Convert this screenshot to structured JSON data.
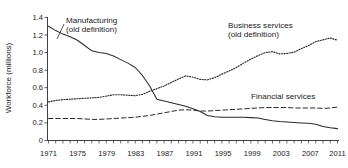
{
  "chart_data": {
    "type": "line",
    "title": "",
    "subtitle": "",
    "xlabel": "",
    "ylabel": "Workforce (millions)",
    "xlim": [
      1971,
      2011
    ],
    "ylim": [
      0,
      1.4
    ],
    "grid": false,
    "legend_position": "inline-annotations",
    "y_ticks": [
      "0",
      "0.2",
      "0.4",
      "0.6",
      "0.8",
      "1.0",
      "1.2",
      "1.4"
    ],
    "y_tick_values": [
      0,
      0.2,
      0.4,
      0.6,
      0.8,
      1.0,
      1.2,
      1.4
    ],
    "x_ticks": [
      "1971",
      "1975",
      "1979",
      "1983",
      "1987",
      "1991",
      "1995",
      "1999",
      "2003",
      "2007",
      "2011"
    ],
    "x_tick_values": [
      1971,
      1975,
      1979,
      1983,
      1987,
      1991,
      1995,
      1999,
      2003,
      2007,
      2011
    ],
    "x_minor_tick_interval": 1,
    "x": [
      1971,
      1972,
      1973,
      1974,
      1975,
      1976,
      1977,
      1978,
      1979,
      1980,
      1981,
      1982,
      1983,
      1984,
      1985,
      1986,
      1987,
      1988,
      1989,
      1990,
      1991,
      1992,
      1993,
      1994,
      1995,
      1996,
      1997,
      1998,
      1999,
      2000,
      2001,
      2002,
      2003,
      2004,
      2005,
      2006,
      2007,
      2008,
      2009,
      2010,
      2011
    ],
    "series": [
      {
        "name": "Manufacturing (old definition)",
        "style": "solid",
        "color": "#2b2b2b",
        "values": [
          1.3,
          1.25,
          1.21,
          1.18,
          1.14,
          1.08,
          1.02,
          1.0,
          0.99,
          0.96,
          0.92,
          0.88,
          0.83,
          0.74,
          0.62,
          0.47,
          0.45,
          0.43,
          0.41,
          0.39,
          0.36,
          0.33,
          0.285,
          0.27,
          0.265,
          0.265,
          0.265,
          0.265,
          0.26,
          0.255,
          0.24,
          0.225,
          0.215,
          0.21,
          0.205,
          0.2,
          0.195,
          0.185,
          0.16,
          0.145,
          0.135
        ]
      },
      {
        "name": "Business services (old definition)",
        "style": "dotted",
        "color": "#2b2b2b",
        "values": [
          0.44,
          0.455,
          0.465,
          0.47,
          0.475,
          0.48,
          0.485,
          0.49,
          0.505,
          0.52,
          0.52,
          0.515,
          0.51,
          0.525,
          0.56,
          0.59,
          0.62,
          0.66,
          0.7,
          0.735,
          0.72,
          0.695,
          0.69,
          0.715,
          0.755,
          0.79,
          0.83,
          0.88,
          0.925,
          0.965,
          1.0,
          1.01,
          0.985,
          0.99,
          1.005,
          1.045,
          1.08,
          1.125,
          1.145,
          1.165,
          1.14
        ]
      },
      {
        "name": "Financial services",
        "style": "dashed",
        "color": "#2b2b2b",
        "values": [
          0.25,
          0.25,
          0.25,
          0.25,
          0.25,
          0.245,
          0.24,
          0.24,
          0.245,
          0.25,
          0.255,
          0.26,
          0.265,
          0.275,
          0.285,
          0.3,
          0.315,
          0.33,
          0.345,
          0.35,
          0.345,
          0.335,
          0.335,
          0.34,
          0.345,
          0.35,
          0.355,
          0.36,
          0.365,
          0.37,
          0.375,
          0.375,
          0.375,
          0.375,
          0.37,
          0.37,
          0.37,
          0.37,
          0.365,
          0.37,
          0.38
        ]
      }
    ],
    "annotations": [
      {
        "id": "manufacturing-label",
        "line1": "Manufacturing",
        "line2": "(old definition)"
      },
      {
        "id": "business-services-label",
        "line1": "Business services",
        "line2": "(old definition)"
      },
      {
        "id": "financial-services-label",
        "line1": "Financial services",
        "line2": ""
      }
    ]
  }
}
